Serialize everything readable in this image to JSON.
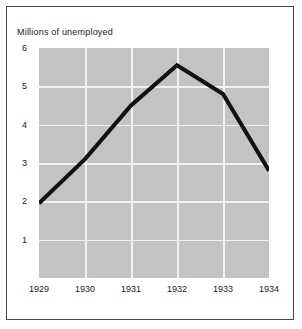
{
  "chart_data": {
    "type": "line",
    "title": "Millions of unemployed",
    "xlabel": "",
    "ylabel": "",
    "categories": [
      "1929",
      "1930",
      "1931",
      "1932",
      "1933",
      "1934"
    ],
    "x": [
      1929,
      1930,
      1931,
      1932,
      1933,
      1934
    ],
    "values": [
      1.95,
      3.1,
      4.5,
      5.55,
      4.8,
      2.8
    ],
    "series": [
      {
        "name": "Millions of unemployed",
        "values": [
          1.95,
          3.1,
          4.5,
          5.55,
          4.8,
          2.8
        ]
      }
    ],
    "ylim": [
      0,
      6
    ],
    "xlim": [
      1929,
      1934
    ],
    "yticks": [
      1,
      2,
      3,
      4,
      5,
      6
    ],
    "ytick_labels": [
      "1",
      "2",
      "3",
      "4",
      "5",
      "6"
    ],
    "xticks": [
      1929,
      1930,
      1931,
      1932,
      1933,
      1934
    ],
    "xtick_labels": [
      "1929",
      "1930",
      "1931",
      "1932",
      "1933",
      "1934"
    ],
    "grid": true,
    "grid_color": "#f2f2f2",
    "legend": false,
    "legend_position": "none",
    "plot_background": "#c3c3c3",
    "line_color": "#111111",
    "line_width": 4,
    "figure_background": "#ffffff",
    "border_color": "#4a4a4a"
  }
}
